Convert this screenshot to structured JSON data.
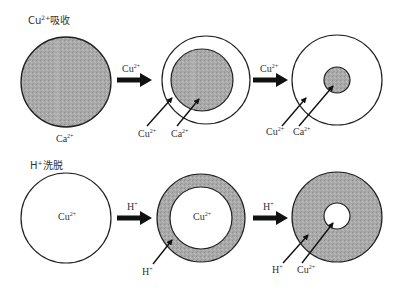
{
  "colors": {
    "shaded": "#a9a9a9",
    "stroke": "#222222",
    "background": "#ffffff",
    "arrow": "#111111"
  },
  "top_row": {
    "title": {
      "base": "Cu",
      "sup": "2+",
      "text": "吸收"
    },
    "stage1": {
      "inner_label": {
        "base": "Ca",
        "sup": "2+"
      }
    },
    "arrow1": {
      "label": {
        "base": "Cu",
        "sup": "2+"
      }
    },
    "stage2": {
      "pointer_labels": [
        {
          "base": "Cu",
          "sup": "2+"
        },
        {
          "base": "Ca",
          "sup": "2+"
        }
      ]
    },
    "arrow2": {
      "label": {
        "base": "Cu",
        "sup": "2+"
      }
    },
    "stage3": {
      "pointer_labels": [
        {
          "base": "Cu",
          "sup": "2+"
        },
        {
          "base": "Ca",
          "sup": "2+"
        }
      ]
    }
  },
  "bottom_row": {
    "title": {
      "base": "H",
      "sup": "+",
      "text": "洗脱"
    },
    "stage1": {
      "inner_label": {
        "base": "Cu",
        "sup": "2+"
      }
    },
    "arrow1": {
      "label": {
        "base": "H",
        "sup": "+"
      }
    },
    "stage2": {
      "inner_label": {
        "base": "Cu",
        "sup": "2+"
      },
      "pointer_labels": [
        {
          "base": "H",
          "sup": "+"
        }
      ]
    },
    "arrow2": {
      "label": {
        "base": "H",
        "sup": "+"
      }
    },
    "stage3": {
      "pointer_labels": [
        {
          "base": "H",
          "sup": "+"
        },
        {
          "base": "Cu",
          "sup": "2+"
        }
      ]
    }
  }
}
